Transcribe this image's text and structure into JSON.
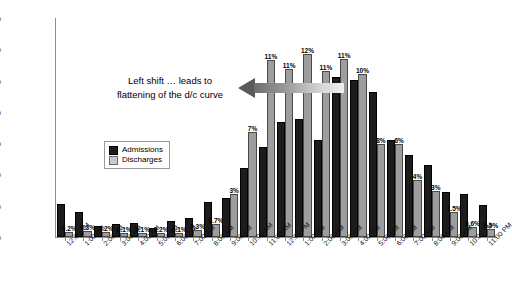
{
  "chart_data": {
    "type": "bar",
    "title": "",
    "xlabel": "",
    "ylabel": "Volume %",
    "ylim": [
      0,
      14
    ],
    "ytick_labels": [
      "0%",
      "2%",
      "4%",
      "6%",
      "8%",
      "10%",
      "12%",
      "14%"
    ],
    "ytick_values": [
      0,
      2,
      4,
      6,
      8,
      10,
      12,
      14
    ],
    "grid": false,
    "legend_position": "inside-left",
    "categories": [
      "12:00 AM",
      "1:00 AM",
      "2:00 AM",
      "3:00 AM",
      "4:00 AM",
      "5:00 AM",
      "6:00 AM",
      "7:00 AM",
      "8:00 AM",
      "9:00 AM",
      "10:00 AM",
      "11:00 AM",
      "12:00 PM",
      "1:00 PM",
      "2:00 PM",
      "3:00 PM",
      "4:00 PM",
      "5:00 PM",
      "6:00 PM",
      "7:00 PM",
      "8:00 PM",
      "9:00 PM",
      "10:00 PM",
      "11:00 PM"
    ],
    "series": [
      {
        "name": "Admissions",
        "color": "#1c1c1c",
        "values": [
          2.0,
          1.45,
          0.6,
          0.7,
          0.75,
          0.45,
          0.9,
          1.1,
          2.1,
          2.35,
          4.3,
          5.6,
          7.2,
          7.4,
          6.1,
          10.1,
          9.9,
          9.15,
          6.05,
          5.1,
          4.45,
          2.75,
          2.6,
          1.9
        ],
        "labels": [
          "",
          "",
          "",
          "",
          "",
          "",
          "",
          "",
          "",
          "",
          "",
          "",
          "",
          "",
          "",
          "",
          "",
          "",
          "",
          "",
          "",
          "",
          "",
          ""
        ]
      },
      {
        "name": "Discharges",
        "color": "#9d9d9d",
        "values": [
          0.2,
          0.25,
          0.2,
          0.1,
          0.1,
          0.1,
          0.1,
          0.3,
          0.7,
          2.6,
          6.6,
          11.2,
          10.6,
          11.55,
          10.5,
          11.25,
          10.3,
          5.8,
          5.8,
          3.5,
          2.8,
          1.45,
          0.5,
          0.4
        ],
        "labels": [
          "0.2%",
          "0.3%",
          "0.2%",
          "0.1%",
          "0.1%",
          "0.2%",
          "0.1%",
          "0.3%",
          "0.7%",
          "3%",
          "7%",
          "11%",
          "11%",
          "12%",
          "11%",
          "11%",
          "10%",
          "8%",
          "6%",
          "4%",
          "3%",
          "1.5%",
          "0.6%",
          "0.5%"
        ]
      }
    ],
    "annotation": {
      "line1": "Left shift … leads to",
      "line2": "flattening of the d/c curve",
      "arrow_direction": "left"
    }
  }
}
